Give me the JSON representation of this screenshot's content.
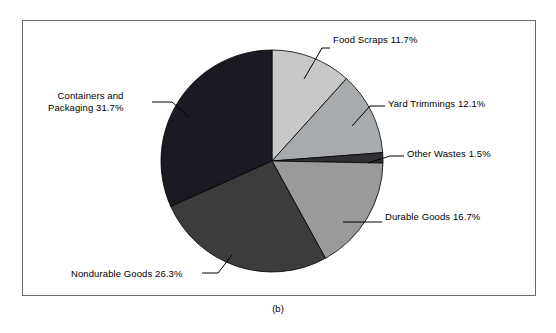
{
  "figure": {
    "caption": "(b)",
    "frame": {
      "border_color": "#6b6b6b",
      "background": "#ffffff"
    }
  },
  "chart_data": {
    "type": "pie",
    "title": "",
    "subtitle": "",
    "xlabel": "",
    "ylabel": "",
    "legend_position": "none",
    "grid": false,
    "start_angle_deg": 0,
    "direction": "clockwise",
    "center": {
      "x": 272,
      "y": 161
    },
    "radius": 111,
    "categories": [
      "Food Scraps",
      "Yard Trimmings",
      "Other Wastes",
      "Durable Goods",
      "Nondurable Goods",
      "Containers and Packaging"
    ],
    "values": [
      11.7,
      12.1,
      1.5,
      16.7,
      26.3,
      31.7
    ],
    "units": "percent",
    "total": 100.0,
    "slices": [
      {
        "name": "Food Scraps",
        "value": 11.7,
        "label": "Food Scraps 11.7%",
        "color": "#c8c8c8",
        "label_side": "right",
        "label_lines": [
          "Food Scraps 11.7%"
        ]
      },
      {
        "name": "Yard Trimmings",
        "value": 12.1,
        "label": "Yard Trimmings 12.1%",
        "color": "#a8abae",
        "label_side": "right",
        "label_lines": [
          "Yard Trimmings 12.1%"
        ]
      },
      {
        "name": "Other Wastes",
        "value": 1.5,
        "label": "Other Wastes 1.5%",
        "color": "#2e2e34",
        "label_side": "right",
        "label_lines": [
          "Other Wastes 1.5%"
        ]
      },
      {
        "name": "Durable Goods",
        "value": 16.7,
        "label": "Durable Goods 16.7%",
        "color": "#9a9a9a",
        "label_side": "right",
        "label_lines": [
          "Durable Goods 16.7%"
        ]
      },
      {
        "name": "Nondurable Goods",
        "value": 26.3,
        "label": "Nondurable Goods 26.3%",
        "color": "#3c3c3c",
        "label_side": "left",
        "label_lines": [
          "Nondurable Goods 26.3%"
        ]
      },
      {
        "name": "Containers and Packaging",
        "value": 31.7,
        "label": "Containers and Packaging 31.7%",
        "color": "#1a1a22",
        "label_side": "left",
        "label_lines": [
          "Containers and",
          "Packaging 31.7%"
        ]
      }
    ]
  },
  "labels": {
    "food_scraps": "Food Scraps 11.7%",
    "yard_trimmings": "Yard Trimmings 12.1%",
    "other_wastes": "Other Wastes 1.5%",
    "durable_goods": "Durable Goods 16.7%",
    "nondurable_goods": "Nondurable Goods 26.3%",
    "containers_line1": "Containers and",
    "containers_line2": "Packaging 31.7%"
  }
}
